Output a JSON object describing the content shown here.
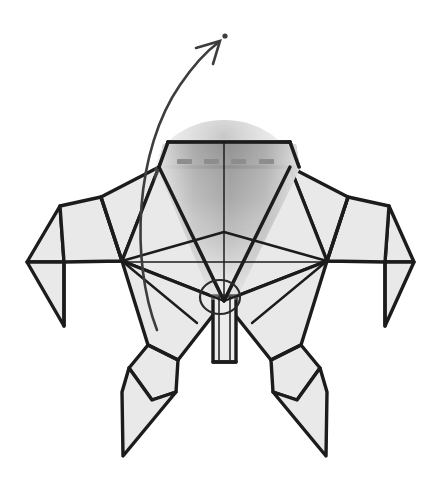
{
  "figure": {
    "background_color": "#ffffff",
    "paper_fill_color": "#e9e9e9",
    "line_color": "#1c1c1c",
    "shade_color": "#8d8d8d",
    "arrow_color": "#3d3d3d",
    "canvas": {
      "width": 436,
      "height": 487
    }
  },
  "annotations": {
    "fold_arrow": {
      "name": "curved-fold-arrow",
      "description": "Large curved arrow sweeping from the body center up and to the upper right",
      "start": {
        "x": 157,
        "y": 330
      },
      "end": {
        "x": 218,
        "y": 41
      },
      "head_style": "open-v",
      "tip_dot": {
        "x": 225,
        "y": 36,
        "r": 2.6
      },
      "color": "#3d3d3d"
    },
    "rotation_circle": {
      "name": "center-rotation-circle",
      "cx": 220,
      "cy": 297,
      "rx": 20,
      "ry": 17,
      "color": "#2a2a2a"
    },
    "dash_marks": {
      "name": "dashed-fold-line",
      "count": 4,
      "color": "#8d8d8d",
      "segments": [
        {
          "x": 177,
          "y": 159,
          "w": 15,
          "h": 5
        },
        {
          "x": 204,
          "y": 159,
          "w": 15,
          "h": 5
        },
        {
          "x": 231,
          "y": 159,
          "w": 15,
          "h": 5
        },
        {
          "x": 259,
          "y": 159,
          "w": 15,
          "h": 5
        }
      ]
    },
    "center_shading": {
      "name": "center-gradient-shade",
      "description": "Soft vertical gradient shading filling the central V valley",
      "dark_value": "#8a8a8a",
      "light_value": "#ffffff"
    }
  },
  "geometry": {
    "top_trapezoid": "M 168,142 L 290,142 L 298,167 L 160,167 Z",
    "head_center_line": {
      "x1": 224,
      "y1": 142,
      "x2": 224,
      "y2": 300
    },
    "left_hub": {
      "x": 122,
      "y": 261
    },
    "right_hub": {
      "x": 327,
      "y": 261
    },
    "left_tip": {
      "x": 27,
      "y": 262
    },
    "right_tip": {
      "x": 414,
      "y": 262
    },
    "bottom_center": {
      "x": 224,
      "y": 362
    },
    "left_leg_tip": {
      "x": 122,
      "y": 456
    },
    "right_leg_tip": {
      "x": 327,
      "y": 456
    }
  },
  "shapes": {
    "left_shoulder": "M 160,167 L 122,261 L 96,199 Z",
    "right_shoulder": "M 298,167 L 327,261 L 353,199 Z",
    "left_arm_upper": "M 96,199 L 122,261 L 63,261 L 60,209 Z",
    "right_arm_upper": "M 353,199 L 327,261 L 386,261 L 389,209 Z",
    "left_arm_claw": "M 60,209 L 63,261 L 27,262 Z",
    "right_arm_claw": "M 389,209 L 386,261 L 414,262 Z",
    "left_claw_lower": "M 63,261 L 63,323 L 27,262 Z",
    "right_claw_lower": "M 386,261 L 386,323 L 414,262 Z",
    "left_body_wedge": "M 122,261 L 224,300 L 171,362 Z",
    "right_body_wedge": "M 327,261 L 224,300 L 278,362 Z",
    "left_inner_flap": "M 160,167 L 224,300 L 122,261 Z",
    "right_inner_flap": "M 298,167 L 224,300 L 327,261 Z",
    "left_leg": "M 171,362 L 196,397 L 152,416 L 122,456 L 129,380 L 148,346 Z",
    "right_leg": "M 278,362 L 253,397 L 297,416 L 327,456 L 320,380 L 301,346 Z",
    "center_tail": "M 212,300 L 237,300 L 237,362 L 212,362 Z"
  }
}
